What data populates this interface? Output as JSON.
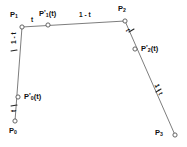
{
  "figure": {
    "background": "#ffffff",
    "line_color": "#6e6e6e",
    "marker_fill": "#ffffff",
    "marker_stroke": "#555555",
    "text_color": "#111111",
    "type": "diagram"
  },
  "points": {
    "p0": {
      "label_base": "P",
      "label_sub": "0",
      "x": 15,
      "y": 121
    },
    "p1": {
      "label_base": "P",
      "label_sub": "1",
      "x": 22,
      "y": 27
    },
    "p2": {
      "label_base": "P",
      "label_sub": "2",
      "x": 125,
      "y": 21
    },
    "p3": {
      "label_base": "P",
      "label_sub": "3",
      "x": 175,
      "y": 135
    },
    "q0": {
      "label_base": "P",
      "label_sub": "0",
      "x": 18,
      "y": 97
    },
    "q1": {
      "label_base": "P",
      "label_sub": "1",
      "x": 48,
      "y": 25
    },
    "q2": {
      "label_base": "P",
      "label_sub": "2",
      "x": 135,
      "y": 49
    }
  },
  "labels": {
    "p0": "P",
    "p0_sub": "0",
    "p1": "P",
    "p1_sub": "1",
    "p2": "P",
    "p2_sub": "2",
    "p3": "P",
    "p3_sub": "3",
    "q0": "P",
    "q0_sub": "0",
    "q0_arg": "(t)",
    "q1": "P",
    "q1_sub": "1",
    "q1_arg": "(t)",
    "q2": "P",
    "q2_sub": "2",
    "q2_arg": "(t)",
    "prime": "'"
  },
  "ratios": {
    "top_left_t": "t",
    "top_right_one_minus_t": "1 - t",
    "left_upper_one_minus_t": "1 - t",
    "left_lower_t": "t",
    "right_upper_t": "t",
    "right_lower_one_minus_t": "1 - t"
  }
}
